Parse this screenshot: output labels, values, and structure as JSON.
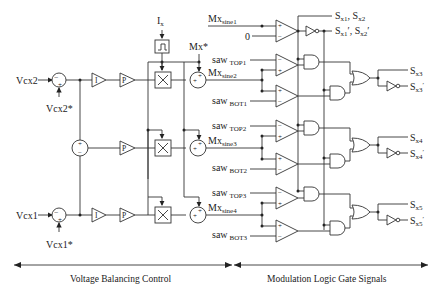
{
  "diagram": {
    "inputs": {
      "vcx2": "Vcx2",
      "vcx2_ref": "Vcx2*",
      "vcx1": "Vcx1",
      "vcx1_ref": "Vcx1*",
      "ix": "I",
      "ix_sub": "x",
      "mx_ref": "Mx*",
      "zero": "0"
    },
    "blocks": {
      "integrator": "I",
      "proportional": "P",
      "sign": "⎍",
      "multiplier": "×",
      "sum_plus": "+",
      "sum_minus": "−"
    },
    "modulation_signals": [
      {
        "main": "Mx",
        "sub": "sine1"
      },
      {
        "main": "Mx",
        "sub": "sine2"
      },
      {
        "main": "Mx",
        "sub": "sine3"
      },
      {
        "main": "Mx",
        "sub": "sine4"
      }
    ],
    "carriers": [
      {
        "main": "saw",
        "sub": "TOP1"
      },
      {
        "main": "saw",
        "sub": "BOT1"
      },
      {
        "main": "saw",
        "sub": "TOP2"
      },
      {
        "main": "saw",
        "sub": "BOT2"
      },
      {
        "main": "saw",
        "sub": "TOP3"
      },
      {
        "main": "saw",
        "sub": "BOT3"
      }
    ],
    "outputs": {
      "s12": {
        "a": "S",
        "a_sub": "x1",
        "sep": ", ",
        "b": "S",
        "b_sub": "x2"
      },
      "s12n": {
        "a": "S",
        "a_sub": "x1",
        "sep": "′, ",
        "b": "S",
        "b_sub": "x2",
        "end": "′"
      },
      "s3": {
        "main": "S",
        "sub": "x3"
      },
      "s3n": {
        "main": "S",
        "sub": "x3",
        "prime": "′"
      },
      "s4": {
        "main": "S",
        "sub": "x4"
      },
      "s4n": {
        "main": "S",
        "sub": "x4",
        "prime": "′"
      },
      "s5": {
        "main": "S",
        "sub": "x5"
      },
      "s5n": {
        "main": "S",
        "sub": "x5",
        "prime": "′"
      }
    },
    "sections": {
      "left": "Voltage Balancing Control",
      "right": "Modulation Logic Gate Signals"
    }
  }
}
